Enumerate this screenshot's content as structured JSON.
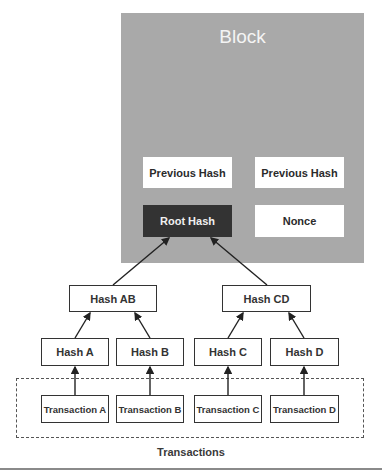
{
  "block": {
    "title": "Block",
    "fields": {
      "previous_hash_1": "Previous Hash",
      "previous_hash_2": "Previous Hash",
      "root_hash": "Root Hash",
      "nonce": "Nonce"
    }
  },
  "tree": {
    "level2": [
      "Hash AB",
      "Hash CD"
    ],
    "level1": [
      "Hash A",
      "Hash B",
      "Hash C",
      "Hash D"
    ],
    "transactions": [
      "Transaction A",
      "Transaction B",
      "Transaction C",
      "Transaction D"
    ]
  },
  "caption": "Transactions",
  "colors": {
    "block_bg": "#a9a9a9",
    "root_hash_bg": "#333333",
    "box_border": "#333333"
  }
}
